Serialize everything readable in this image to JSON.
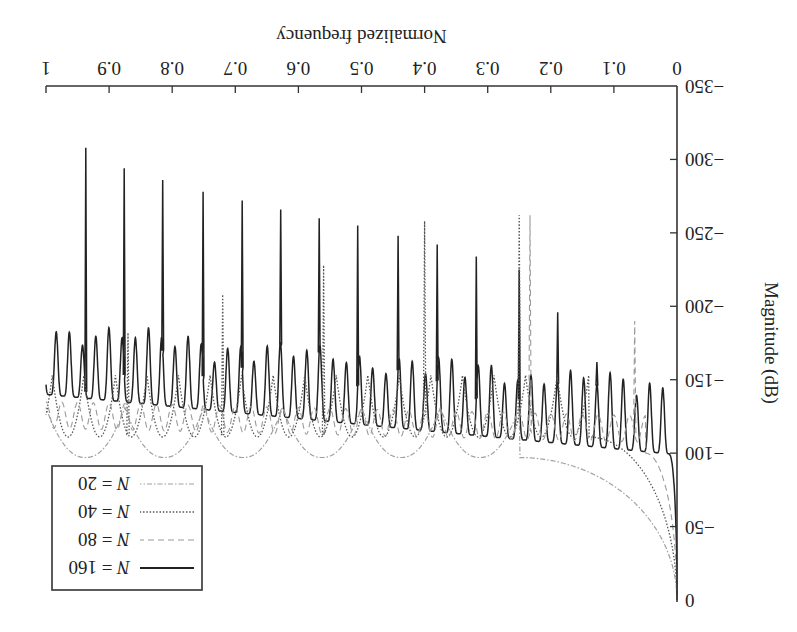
{
  "chart_data": {
    "type": "line",
    "title": "",
    "orientation_note": "figure rendered rotated 180 degrees",
    "xlabel": "Normalized frequency",
    "ylabel": "Magnitude (dB)",
    "xlim": [
      0,
      1
    ],
    "ylim": [
      -350,
      0
    ],
    "xticks": [
      0,
      0.1,
      0.2,
      0.3,
      0.4,
      0.5,
      0.6,
      0.7,
      0.8,
      0.9,
      1
    ],
    "xtick_labels": [
      "0",
      "0.1",
      "0.2",
      "0.3",
      "0.4",
      "0.5",
      "0.6",
      "0.7",
      "0.8",
      "0.9",
      "1"
    ],
    "yticks": [
      0,
      -50,
      -100,
      -150,
      -200,
      -250,
      -300,
      -350
    ],
    "ytick_labels": [
      "0",
      "−50",
      "−100",
      "−150",
      "−200",
      "−250",
      "−300",
      "−350"
    ],
    "grid": false,
    "legend_position": "lower-left (appears top-right after rotation)",
    "series": [
      {
        "name": "N = 160",
        "style": "solid",
        "color": "#222222",
        "description": "rapid rolloff from 0 dB at f=0 to about -100 dB by f≈0.01; dense ripple with ~45 small peaks; trough floor rises from -99 dB (f≈0.03) to -140 dB (f≈1); minor peaks between -150 and -180 dB; large spikes every 1/16",
        "floor_db_at_f0": -99,
        "floor_db_at_f1": -140,
        "ripple_period": 0.0209,
        "ripple_peak_db_range": [
          -150,
          -185
        ],
        "major_spikes": [
          {
            "f": 0.127,
            "db": -162
          },
          {
            "f": 0.189,
            "db": -196
          },
          {
            "f": 0.25,
            "db": -225
          },
          {
            "f": 0.318,
            "db": -234
          },
          {
            "f": 0.38,
            "db": -242
          },
          {
            "f": 0.442,
            "db": -248
          },
          {
            "f": 0.506,
            "db": -255
          },
          {
            "f": 0.567,
            "db": -260
          },
          {
            "f": 0.628,
            "db": -266
          },
          {
            "f": 0.689,
            "db": -272
          },
          {
            "f": 0.751,
            "db": -278
          },
          {
            "f": 0.815,
            "db": -286
          },
          {
            "f": 0.876,
            "db": -294
          },
          {
            "f": 0.937,
            "db": -308
          }
        ]
      },
      {
        "name": "N = 80",
        "style": "dashed",
        "color": "#9a9a9a",
        "description": "rolloff reaching about -100 dB by f≈0.05; scalloped floor near -120 to -140 dB; spikes at f≈0.23 (-260 dB) and f≈0.07 (-190 dB)",
        "rolloff_end_f": 0.05,
        "floor_db": -125,
        "major_spikes": [
          {
            "f": 0.067,
            "db": -190
          },
          {
            "f": 0.233,
            "db": -262
          }
        ]
      },
      {
        "name": "N = 40",
        "style": "dotted",
        "color": "#555555",
        "description": "rolloff to about -100 dB by f≈0.14; scallops of period ≈0.05 with troughs near -111 dB; tall spikes at f≈0.25 (-262 dB) and f≈0.40 (-258 dB)",
        "rolloff_end_f": 0.14,
        "floor_db": -111,
        "scallop_period": 0.05,
        "major_spikes": [
          {
            "f": 0.25,
            "db": -262
          },
          {
            "f": 0.4,
            "db": -258
          },
          {
            "f": 0.56,
            "db": -228
          },
          {
            "f": 0.72,
            "db": -208
          },
          {
            "f": 0.87,
            "db": -182
          }
        ]
      },
      {
        "name": "N = 20",
        "style": "dash-dot",
        "color": "#a0a0a0",
        "description": "slow rolloff reaching about -97 dB by f≈0.25; wide scallops with period ≈0.125, troughs ≈ -97 dB, cusps ≈ -130 dB",
        "rolloff_end_f": 0.25,
        "floor_db": -97,
        "scallop_period": 0.125
      }
    ],
    "legend": [
      "N = 160",
      "N = 80",
      "N = 40",
      "N = 20"
    ]
  },
  "legend": {
    "items": [
      {
        "label_var": "N",
        "label_val": " = 160"
      },
      {
        "label_var": "N",
        "label_val": " = 80"
      },
      {
        "label_var": "N",
        "label_val": " = 40"
      },
      {
        "label_var": "N",
        "label_val": " = 20"
      }
    ]
  }
}
